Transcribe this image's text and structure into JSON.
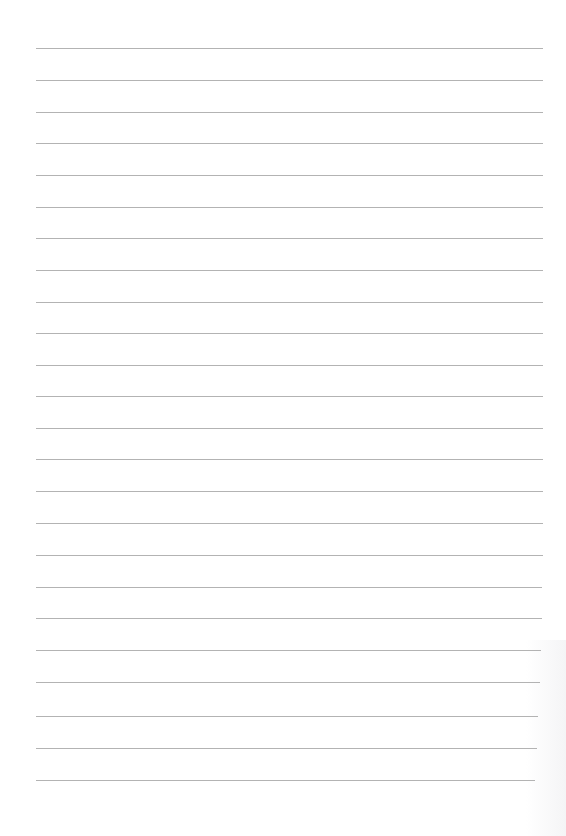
{
  "page": {
    "type": "lined-paper",
    "background": "#ffffff",
    "line_color": "#9a9a9a",
    "lines": [
      {
        "y": 48,
        "x1": 36,
        "x2": 543
      },
      {
        "y": 80,
        "x1": 36,
        "x2": 543
      },
      {
        "y": 112,
        "x1": 36,
        "x2": 543
      },
      {
        "y": 143,
        "x1": 36,
        "x2": 543
      },
      {
        "y": 175,
        "x1": 36,
        "x2": 543
      },
      {
        "y": 207,
        "x1": 36,
        "x2": 543
      },
      {
        "y": 238,
        "x1": 36,
        "x2": 543
      },
      {
        "y": 270,
        "x1": 36,
        "x2": 543
      },
      {
        "y": 302,
        "x1": 36,
        "x2": 543
      },
      {
        "y": 333,
        "x1": 36,
        "x2": 543
      },
      {
        "y": 365,
        "x1": 36,
        "x2": 543
      },
      {
        "y": 396,
        "x1": 36,
        "x2": 543
      },
      {
        "y": 428,
        "x1": 36,
        "x2": 543
      },
      {
        "y": 459,
        "x1": 36,
        "x2": 543
      },
      {
        "y": 491,
        "x1": 36,
        "x2": 543
      },
      {
        "y": 523,
        "x1": 36,
        "x2": 543
      },
      {
        "y": 555,
        "x1": 36,
        "x2": 543
      },
      {
        "y": 587,
        "x1": 36,
        "x2": 542
      },
      {
        "y": 618,
        "x1": 36,
        "x2": 542
      },
      {
        "y": 650,
        "x1": 36,
        "x2": 541
      },
      {
        "y": 682,
        "x1": 36,
        "x2": 540
      },
      {
        "y": 716,
        "x1": 36,
        "x2": 538
      },
      {
        "y": 748,
        "x1": 36,
        "x2": 537
      },
      {
        "y": 780,
        "x1": 36,
        "x2": 535
      }
    ]
  }
}
